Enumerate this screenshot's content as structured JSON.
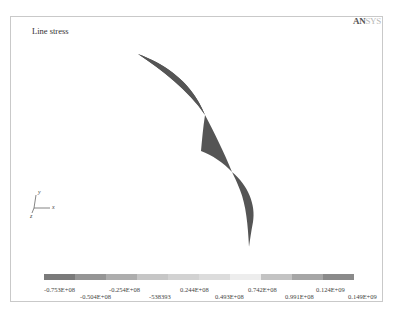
{
  "window": {
    "title": "Line stress",
    "brand_part1": "AN",
    "brand_part2": "SYS"
  },
  "triad": {
    "x_label": "x",
    "y_label": "y",
    "z_label": "z"
  },
  "legend": {
    "colors": [
      "#7a7a7a",
      "#959595",
      "#a8a8a8",
      "#c4c4c4",
      "#d4d4d4",
      "#dedede",
      "#ebebeb",
      "#c6c6c6",
      "#ababab",
      "#8e8e8e"
    ],
    "labels_row1": [
      "-0.753E+08",
      "-0.254E+08",
      "0.244E+08",
      "0.742E+08",
      "0.124E+09"
    ],
    "labels_row2": [
      "-0.504E+08",
      "-538393",
      "0.493E+08",
      "0.991E+08",
      "0.149E+09"
    ]
  },
  "plot": {
    "shape_fill": "#555555"
  }
}
